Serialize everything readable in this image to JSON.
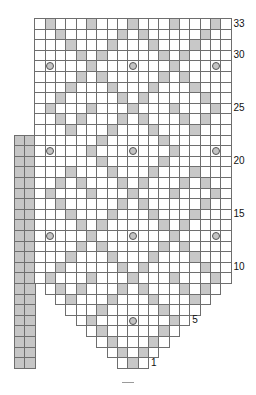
{
  "chart_title": "",
  "colors": {
    "grid_line": "#6e6e6e",
    "purl_fill": "#c8c8c8",
    "empty_fill": "#ffffff",
    "side_bar_fill": "#c6c6c6",
    "circle_fill": "#c4c4c4",
    "circle_stroke": "#555555"
  },
  "geometry": {
    "grid_left": 34.3,
    "grid_top": 18,
    "cell_w": 10.33,
    "cell_h": 10.6,
    "total_cols": 19,
    "total_rows": 33
  },
  "row_labels": [
    {
      "row": 33,
      "text": "33"
    },
    {
      "row": 30,
      "text": "30"
    },
    {
      "row": 25,
      "text": "25"
    },
    {
      "row": 20,
      "text": "20"
    },
    {
      "row": 15,
      "text": "15"
    },
    {
      "row": 10,
      "text": "10"
    },
    {
      "row": 5,
      "text": "5"
    },
    {
      "row": 1,
      "text": "1"
    }
  ],
  "side_bar": {
    "cols": 2,
    "x": 14,
    "from_row": 1,
    "to_row": 22
  },
  "chart_data": {
    "type": "table",
    "legend": {
      "gray": "shaded stitch",
      "circle": "bobble / circle symbol",
      "white": "plain stitch"
    },
    "rows": [
      {
        "row": 33,
        "span": [
          1,
          19
        ],
        "gray": [
          2,
          6,
          10,
          14,
          18
        ],
        "circles": []
      },
      {
        "row": 32,
        "span": [
          1,
          19
        ],
        "gray": [
          3,
          9,
          11,
          17
        ],
        "circles": []
      },
      {
        "row": 31,
        "span": [
          1,
          19
        ],
        "gray": [
          4,
          8,
          12,
          16
        ],
        "circles": []
      },
      {
        "row": 30,
        "span": [
          1,
          19
        ],
        "gray": [
          5,
          7,
          13,
          15
        ],
        "circles": []
      },
      {
        "row": 29,
        "span": [
          1,
          19
        ],
        "gray": [
          6,
          14
        ],
        "circles": [
          2,
          10,
          18
        ]
      },
      {
        "row": 28,
        "span": [
          1,
          19
        ],
        "gray": [
          5,
          7,
          13,
          15
        ],
        "circles": []
      },
      {
        "row": 27,
        "span": [
          1,
          19
        ],
        "gray": [
          4,
          8,
          12,
          16
        ],
        "circles": []
      },
      {
        "row": 26,
        "span": [
          1,
          19
        ],
        "gray": [
          3,
          9,
          11,
          17
        ],
        "circles": []
      },
      {
        "row": 25,
        "span": [
          1,
          19
        ],
        "gray": [
          2,
          6,
          10,
          14,
          18
        ],
        "circles": []
      },
      {
        "row": 24,
        "span": [
          1,
          19
        ],
        "gray": [
          3,
          5,
          9,
          11,
          15,
          17
        ],
        "circles": []
      },
      {
        "row": 23,
        "span": [
          1,
          19
        ],
        "gray": [
          4,
          8,
          12,
          16
        ],
        "circles": []
      },
      {
        "row": 22,
        "span": [
          1,
          19
        ],
        "gray": [
          7,
          13
        ],
        "circles": []
      },
      {
        "row": 21,
        "span": [
          1,
          19
        ],
        "gray": [
          6,
          14
        ],
        "circles": [
          2,
          10,
          18
        ]
      },
      {
        "row": 20,
        "span": [
          1,
          19
        ],
        "gray": [
          7,
          13
        ],
        "circles": []
      },
      {
        "row": 19,
        "span": [
          1,
          19
        ],
        "gray": [
          4,
          8,
          12,
          16
        ],
        "circles": []
      },
      {
        "row": 18,
        "span": [
          1,
          19
        ],
        "gray": [
          3,
          5,
          9,
          11,
          15,
          17
        ],
        "circles": []
      },
      {
        "row": 17,
        "span": [
          1,
          19
        ],
        "gray": [
          2,
          6,
          10,
          14,
          18
        ],
        "circles": []
      },
      {
        "row": 16,
        "span": [
          1,
          19
        ],
        "gray": [
          3,
          9,
          11,
          17
        ],
        "circles": []
      },
      {
        "row": 15,
        "span": [
          1,
          19
        ],
        "gray": [
          4,
          8,
          12,
          16
        ],
        "circles": []
      },
      {
        "row": 14,
        "span": [
          1,
          19
        ],
        "gray": [
          5,
          7,
          13,
          15
        ],
        "circles": []
      },
      {
        "row": 13,
        "span": [
          1,
          19
        ],
        "gray": [
          6,
          14
        ],
        "circles": [
          2,
          10,
          18
        ]
      },
      {
        "row": 12,
        "span": [
          1,
          19
        ],
        "gray": [
          5,
          7,
          13,
          15
        ],
        "circles": []
      },
      {
        "row": 11,
        "span": [
          1,
          19
        ],
        "gray": [
          4,
          8,
          12,
          16
        ],
        "circles": []
      },
      {
        "row": 10,
        "span": [
          1,
          19
        ],
        "gray": [
          3,
          9,
          11,
          17
        ],
        "circles": []
      },
      {
        "row": 9,
        "span": [
          1,
          19
        ],
        "gray": [
          2,
          6,
          10,
          14,
          18
        ],
        "circles": []
      },
      {
        "row": 8,
        "span": [
          2,
          18
        ],
        "gray": [
          3,
          5,
          9,
          11,
          15,
          17
        ],
        "circles": []
      },
      {
        "row": 7,
        "span": [
          3,
          17
        ],
        "gray": [
          4,
          8,
          12,
          16
        ],
        "circles": []
      },
      {
        "row": 6,
        "span": [
          4,
          16
        ],
        "gray": [
          7,
          13
        ],
        "circles": []
      },
      {
        "row": 5,
        "span": [
          5,
          15
        ],
        "gray": [
          6,
          14
        ],
        "circles": [
          10
        ]
      },
      {
        "row": 4,
        "span": [
          6,
          14
        ],
        "gray": [
          7,
          13
        ],
        "circles": []
      },
      {
        "row": 3,
        "span": [
          7,
          13
        ],
        "gray": [
          8,
          12
        ],
        "circles": []
      },
      {
        "row": 2,
        "span": [
          8,
          12
        ],
        "gray": [
          9,
          11
        ],
        "circles": []
      },
      {
        "row": 1,
        "span": [
          9,
          11
        ],
        "gray": [
          10
        ],
        "circles": []
      }
    ]
  },
  "footer_mark": {
    "x": 122,
    "y": 382,
    "w": 12
  }
}
